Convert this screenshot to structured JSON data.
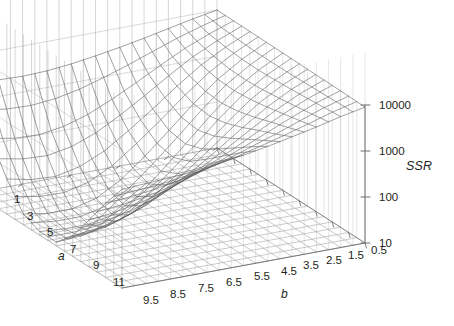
{
  "figure": {
    "kind": "3d-wireframe-surface",
    "background": "#ffffff",
    "line_color": "#6d6e71",
    "mesh_color": "#58595b",
    "floor_color": "#8b8c8e"
  },
  "axes": {
    "x": {
      "name": "a",
      "title": "a",
      "ticks": [
        "1",
        "3",
        "5",
        "7",
        "9",
        "11"
      ],
      "values": [
        1,
        3,
        5,
        7,
        9,
        11
      ],
      "range": [
        1,
        11
      ]
    },
    "y": {
      "name": "b",
      "title": "b",
      "ticks": [
        "9.5",
        "8.5",
        "7.5",
        "6.5",
        "5.5",
        "4.5",
        "3.5",
        "2.5",
        "1.5",
        "0.5"
      ],
      "values": [
        9.5,
        8.5,
        7.5,
        6.5,
        5.5,
        4.5,
        3.5,
        2.5,
        1.5,
        0.5
      ],
      "range": [
        9.5,
        0.5
      ]
    },
    "z": {
      "name": "SSR",
      "title": "SSR",
      "ticks": [
        "10",
        "100",
        "1000",
        "10000"
      ],
      "values": [
        10,
        100,
        1000,
        10000
      ],
      "scale": "log",
      "range": [
        10,
        10000
      ]
    }
  },
  "chart_data": {
    "type": "surface",
    "title": "",
    "xlabel": "a",
    "ylabel": "b",
    "zlabel": "SSR",
    "zscale": "log",
    "zlim": [
      10,
      10000
    ],
    "xlim": [
      1,
      11
    ],
    "ylim": [
      0.5,
      9.5
    ],
    "grid": true,
    "legend": "none",
    "x": [
      1,
      2,
      3,
      4,
      5,
      6,
      7,
      8,
      9,
      10,
      11
    ],
    "y": [
      0.5,
      1.5,
      2.5,
      3.5,
      4.5,
      5.5,
      6.5,
      7.5,
      8.5,
      9.5
    ],
    "z_rows_by_y": [
      {
        "y": 9.5,
        "z": [
          9000,
          7000,
          5200,
          4000,
          3100,
          2500,
          2100,
          1800,
          1600,
          1500,
          1400
        ]
      },
      {
        "y": 8.5,
        "z": [
          9200,
          6500,
          4200,
          2700,
          1800,
          1200,
          850,
          640,
          520,
          450,
          410
        ]
      },
      {
        "y": 7.5,
        "z": [
          9300,
          6000,
          3500,
          1900,
          1000,
          560,
          330,
          210,
          150,
          120,
          105
        ]
      },
      {
        "y": 6.5,
        "z": [
          9400,
          5600,
          2900,
          1300,
          560,
          250,
          120,
          65,
          42,
          32,
          28
        ]
      },
      {
        "y": 5.5,
        "z": [
          9500,
          5300,
          2500,
          950,
          330,
          120,
          48,
          24,
          16,
          13,
          12
        ]
      },
      {
        "y": 4.5,
        "z": [
          9600,
          5100,
          2300,
          800,
          250,
          80,
          28,
          14,
          11,
          11,
          12
        ]
      },
      {
        "y": 3.5,
        "z": [
          9700,
          5200,
          2400,
          880,
          290,
          100,
          38,
          19,
          14,
          14,
          17
        ]
      },
      {
        "y": 2.5,
        "z": [
          9800,
          5600,
          2900,
          1250,
          500,
          210,
          95,
          55,
          42,
          45,
          58
        ]
      },
      {
        "y": 1.5,
        "z": [
          9900,
          6400,
          3900,
          2100,
          1100,
          600,
          350,
          240,
          200,
          210,
          260
        ]
      },
      {
        "y": 0.5,
        "z": [
          10000,
          8000,
          6200,
          4800,
          3800,
          3100,
          2600,
          2300,
          2200,
          2300,
          2600
        ]
      }
    ],
    "minimum": {
      "a": 9,
      "b": 4.5,
      "ssr": 11
    }
  }
}
